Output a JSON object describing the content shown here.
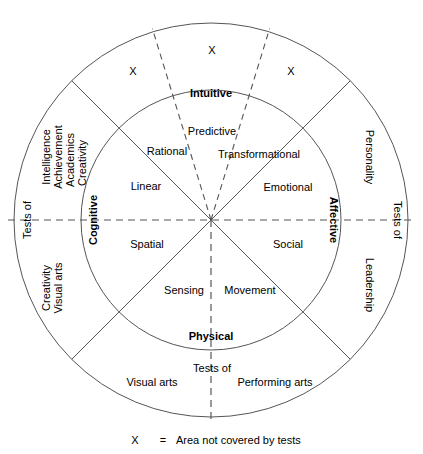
{
  "diagram": {
    "center": {
      "x": 211,
      "y": 220
    },
    "radii": {
      "inner": 130,
      "outer": 197
    },
    "quadrant_labels": [
      {
        "name": "intuitive",
        "text": "Intuitive",
        "angle_deg": -90
      },
      {
        "name": "affective",
        "text": "Affective",
        "angle_deg": 0
      },
      {
        "name": "physical",
        "text": "Physical",
        "angle_deg": 90
      },
      {
        "name": "cognitive",
        "text": "Cognitive",
        "angle_deg": 180
      }
    ],
    "inner_segments": [
      {
        "name": "rational",
        "text": "Rational",
        "x": 167,
        "y": 155
      },
      {
        "name": "predictive",
        "text": "Predictive",
        "x": 211,
        "y": 134
      },
      {
        "name": "transformational",
        "text": "Transformational",
        "x": 256,
        "y": 155
      },
      {
        "name": "linear",
        "text": "Linear",
        "x": 146,
        "y": 188
      },
      {
        "name": "emotional",
        "text": "Emotional",
        "x": 288,
        "y": 190
      },
      {
        "name": "spatial",
        "text": "Spatial",
        "x": 147,
        "y": 246
      },
      {
        "name": "social",
        "text": "Social",
        "x": 288,
        "y": 246
      },
      {
        "name": "sensing",
        "text": "Sensing",
        "x": 185,
        "y": 292
      },
      {
        "name": "movement",
        "text": "Movement",
        "x": 249,
        "y": 292
      }
    ],
    "outer_ring": {
      "left_tests_of": "Tests of",
      "right_tests_of": "Tests of",
      "bottom_tests_of": "Tests of",
      "left_upper_items": [
        "Intelligence",
        "Achievement",
        "Academics",
        "Creativity"
      ],
      "left_lower_items": [
        "Creativity",
        "Visual arts"
      ],
      "right_upper_items": [
        "Personality"
      ],
      "right_lower_items": [
        "Leadership"
      ],
      "bottom_left_item": "Visual arts",
      "bottom_right_item": "Performing arts"
    },
    "x_marks": [
      {
        "name": "x-mark-left",
        "label": "X",
        "x": 133,
        "y": 71
      },
      {
        "name": "x-mark-center",
        "label": "X",
        "x": 212,
        "y": 50
      },
      {
        "name": "x-mark-right",
        "label": "X",
        "x": 291,
        "y": 71
      }
    ],
    "legend": {
      "symbol": "X",
      "equals": "=",
      "text": "Area not covered by tests"
    },
    "colors": {
      "stroke": "#555555",
      "text": "#000000",
      "background": "#ffffff"
    }
  }
}
